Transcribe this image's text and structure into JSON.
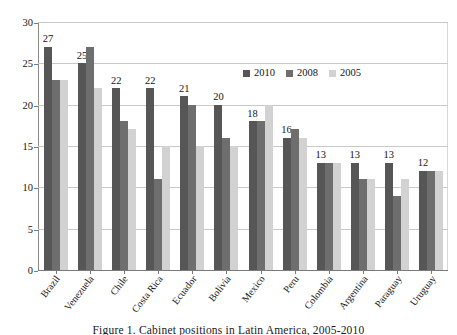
{
  "chart_data": {
    "type": "bar",
    "title": "",
    "xlabel": "",
    "ylabel": "",
    "ylim": [
      0,
      30
    ],
    "yticks": [
      0,
      5,
      10,
      15,
      20,
      25,
      30
    ],
    "grid": true,
    "legend_position": "inside-top-right",
    "categories": [
      "Brazil",
      "Venezuela",
      "Chile",
      "Costa Rica",
      "Ecuador",
      "Bolivia",
      "Mexico",
      "Peru",
      "Colombia",
      "Argentina",
      "Paraguay",
      "Uruguay"
    ],
    "series": [
      {
        "name": "2010",
        "color": "#565656",
        "values": [
          27,
          25,
          22,
          22,
          21,
          20,
          18,
          16,
          13,
          13,
          13,
          12
        ]
      },
      {
        "name": "2008",
        "color": "#6e6e6e",
        "values": [
          23,
          27,
          18,
          11,
          20,
          16,
          18,
          17,
          13,
          11,
          9,
          12
        ]
      },
      {
        "name": "2005",
        "color": "#d2d2d2",
        "values": [
          23,
          22,
          17,
          15,
          15,
          15,
          20,
          16,
          13,
          11,
          11,
          12
        ]
      }
    ],
    "data_labels": {
      "series": "2010",
      "values": [
        "27",
        "25",
        "22",
        "22",
        "21",
        "20",
        "18",
        "16",
        "13",
        "13",
        "13",
        "12"
      ]
    }
  },
  "caption": {
    "text": "Figure 1.  Cabinet positions in Latin America, 2005-2010"
  }
}
